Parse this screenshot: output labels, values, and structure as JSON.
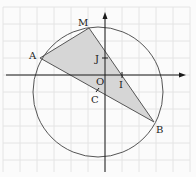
{
  "diagram": {
    "title": "",
    "colors": {
      "background": "#fbfbfb",
      "grid": "#e4e4e4",
      "axis": "#1a1a1a",
      "circle": "#555555",
      "triangle_fill": "#d6d6d6",
      "triangle_stroke": "#555555"
    },
    "points": {
      "O": {
        "label": "O"
      },
      "I": {
        "label": "I"
      },
      "J": {
        "label": "J"
      },
      "A": {
        "label": "A"
      },
      "B": {
        "label": "B"
      },
      "M": {
        "label": "M"
      },
      "C": {
        "label": "C"
      }
    },
    "shapes": {
      "circle": "circle-centered-at-C",
      "triangle": "AMB"
    }
  }
}
